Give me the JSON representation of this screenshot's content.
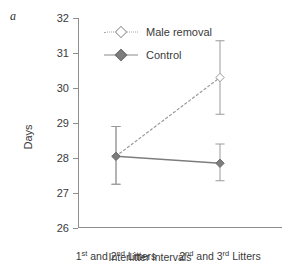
{
  "panel": {
    "label": "a"
  },
  "legend": {
    "position": "inside-top-left",
    "items": [
      {
        "label": "Male removal",
        "marker": "open-diamond-icon",
        "line": "dashed",
        "color": "#9a9a9a"
      },
      {
        "label": "Control",
        "marker": "filled-diamond-icon",
        "line": "solid",
        "color": "#7d7d7d"
      }
    ]
  },
  "chart_data": {
    "type": "line",
    "title": "",
    "subtitle": "",
    "xlabel": "Interlitter intervals",
    "ylabel": "Days",
    "categories": [
      "1st and 2nd Litters",
      "2nd and 3rd Litters"
    ],
    "category_parts": [
      {
        "ordinal1": "1",
        "sup1": "st",
        "mid": " and ",
        "ordinal2": "2",
        "sup2": "nd",
        "tail": " Litters"
      },
      {
        "ordinal1": "2",
        "sup1": "nd",
        "mid": " and ",
        "ordinal2": "3",
        "sup2": "rd",
        "tail": " Litters"
      }
    ],
    "ylim": [
      26,
      32
    ],
    "yticks": [
      32,
      31,
      30,
      29,
      28,
      27,
      26
    ],
    "ytick_labels": [
      "32",
      "31",
      "30",
      "29",
      "28",
      "27",
      "26"
    ],
    "grid": false,
    "errorbars": true,
    "series": [
      {
        "name": "Male removal",
        "marker": "open-diamond",
        "linestyle": "dashed",
        "color": "#9a9a9a",
        "values": [
          28.05,
          30.3
        ],
        "err_low": [
          27.25,
          29.25
        ],
        "err_high": [
          28.9,
          31.35
        ]
      },
      {
        "name": "Control",
        "marker": "filled-diamond",
        "linestyle": "solid",
        "color": "#7d7d7d",
        "values": [
          28.05,
          27.85
        ],
        "err_low": [
          27.25,
          27.35
        ],
        "err_high": [
          28.9,
          28.4
        ]
      }
    ]
  }
}
